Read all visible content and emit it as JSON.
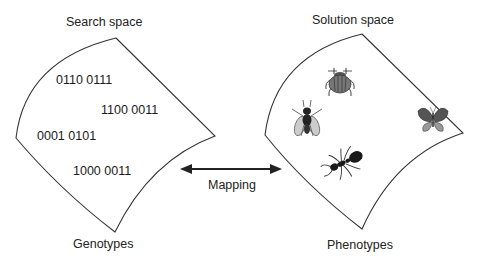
{
  "search_space": {
    "title": "Search space",
    "footer": "Genotypes",
    "genotypes": [
      {
        "code": "0110 0111"
      },
      {
        "code": "1100 0011"
      },
      {
        "code": "0001 0101"
      },
      {
        "code": "1000 0011"
      }
    ]
  },
  "mapping": {
    "label": "Mapping",
    "direction": "bidirectional"
  },
  "solution_space": {
    "title": "Solution space",
    "footer": "Phenotypes",
    "phenotypes": [
      {
        "name": "beetle",
        "icon": "beetle-icon"
      },
      {
        "name": "fly",
        "icon": "fly-icon"
      },
      {
        "name": "butterfly",
        "icon": "butterfly-icon"
      },
      {
        "name": "ant",
        "icon": "ant-icon"
      }
    ]
  },
  "colors": {
    "stroke": "#333333",
    "text": "#222222",
    "background": "#ffffff"
  }
}
